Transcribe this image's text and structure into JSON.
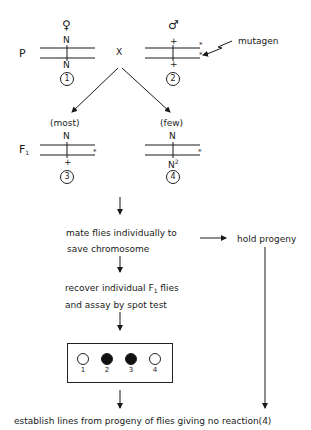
{
  "generation_labels": {
    "parental": "P",
    "f1": "F",
    "f1_sub": "1"
  },
  "cross_symbol": "X",
  "parents": {
    "female": {
      "sex_symbol": "♀",
      "top_allele": "N",
      "bottom_allele": "N",
      "number": "1"
    },
    "male": {
      "sex_symbol": "♂",
      "top_allele": "+",
      "bottom_allele": "+",
      "number": "2",
      "mark": "*"
    }
  },
  "mutagen_label": "mutagen",
  "offspring": {
    "most": {
      "label": "(most)",
      "top_allele": "N",
      "bottom_allele": "+",
      "number": "3",
      "mark": "*"
    },
    "few": {
      "label": "(few)",
      "top_allele": "N",
      "bottom_allele": "N",
      "bottom_allele_sup": "2",
      "number": "4",
      "mark": "*"
    }
  },
  "steps": {
    "mate_line1": "mate flies individually to",
    "mate_line2": "save chromosome",
    "hold": "hold progeny",
    "recover_line1_pre": "recover individual F",
    "recover_line1_sub": "1",
    "recover_line1_post": " flies",
    "recover_line2": "and assay by spot test",
    "establish": "establish lines from progeny of flies giving no reaction(4)"
  },
  "spot_test": {
    "wells": [
      {
        "label": "1",
        "reaction": false
      },
      {
        "label": "2",
        "reaction": true
      },
      {
        "label": "3",
        "reaction": true
      },
      {
        "label": "4",
        "reaction": false
      }
    ]
  },
  "colors": {
    "ink": "#1a1a1a",
    "background": "#ffffff"
  }
}
